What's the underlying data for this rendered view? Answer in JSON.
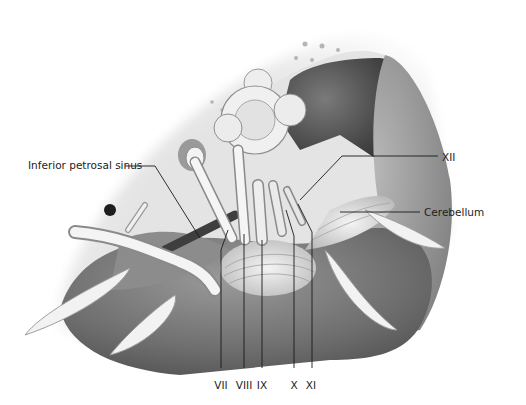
{
  "figure": {
    "palette": {
      "background": "#ffffff",
      "bone_light": "#e6e6e6",
      "bone_mid": "#c9c9c9",
      "dark_vessel": "#3a3a3a",
      "tissue_mid": "#8a8a8a",
      "tissue_dark": "#5e5e5e",
      "nerve_light": "#f2f2f2",
      "leader_line": "#1a1a1a"
    }
  },
  "labels": {
    "inferior_petrosal_sinus": "Inferior petrosal sinus",
    "xii": "XII",
    "cerebellum": "Cerebellum",
    "vii": "VII",
    "viii": "VIII",
    "ix": "IX",
    "x": "X",
    "xi": "XI"
  }
}
